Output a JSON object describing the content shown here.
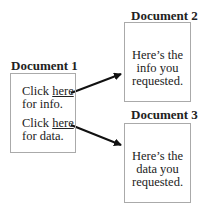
{
  "doc1": {
    "title": "Document 1",
    "link1": {
      "prefix": "Click ",
      "link": "here",
      "suffix": "for info."
    },
    "link2": {
      "prefix": "Click ",
      "link": "here",
      "suffix": "for data."
    }
  },
  "doc2": {
    "title": "Document 2",
    "lines": [
      "Here’s the",
      "info you",
      "requested."
    ]
  },
  "doc3": {
    "title": "Document 3",
    "lines": [
      "Here’s the",
      "data you",
      "requested."
    ]
  }
}
